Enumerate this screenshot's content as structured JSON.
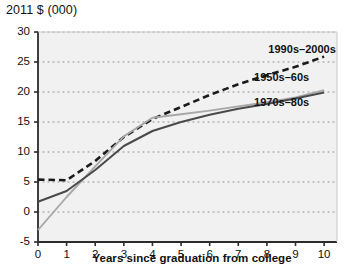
{
  "chart_data": {
    "type": "line",
    "title": "",
    "ylabel": "2011 $ (000)",
    "xlabel": "Years since graduation from college",
    "x": [
      0,
      1,
      2,
      3,
      4,
      5,
      6,
      7,
      8,
      9,
      10
    ],
    "xlim": [
      0,
      10.45
    ],
    "ylim": [
      -5,
      30
    ],
    "ytick_labels": [
      "30",
      "25",
      "20",
      "15",
      "10",
      "5",
      "0",
      "-5"
    ],
    "ytick_values": [
      30,
      25,
      20,
      15,
      10,
      5,
      0,
      -5
    ],
    "xtick_labels": [
      "0",
      "1",
      "2",
      "3",
      "4",
      "5",
      "6",
      "7",
      "8",
      "9",
      "10"
    ],
    "xtick_values": [
      0,
      1,
      2,
      3,
      4,
      5,
      6,
      7,
      8,
      9,
      10
    ],
    "grid": true,
    "grid_style": "dotted-horizontal",
    "legend_position": "inline-annotations",
    "series": [
      {
        "name": "1990s-2000s",
        "label": "1990s–2000s",
        "color": "#1a1a1a",
        "style": "dashed",
        "width": 2.6,
        "label_x": 8.05,
        "label_y": 27.0,
        "values": [
          5.4,
          5.3,
          8.5,
          12.5,
          15.5,
          17.5,
          19.5,
          21.3,
          22.8,
          24.2,
          25.9
        ]
      },
      {
        "name": "1950s-60s",
        "label": "1950s–60s",
        "color": "#a8a8a8",
        "style": "solid",
        "width": 1.9,
        "label_x": 7.55,
        "label_y": 22.4,
        "values": [
          -3.0,
          2.5,
          7.6,
          12.6,
          15.7,
          16.3,
          16.9,
          17.6,
          18.3,
          19.1,
          20.3
        ]
      },
      {
        "name": "1970s-80s",
        "label": "1970s–80s",
        "color": "#4a4a4a",
        "style": "solid",
        "width": 2.0,
        "label_x": 7.55,
        "label_y": 18.1,
        "values": [
          1.7,
          3.5,
          7.0,
          11.0,
          13.5,
          15.0,
          16.2,
          17.2,
          18.0,
          18.9,
          19.9
        ]
      }
    ],
    "colors": {
      "axis": "#2b2b2b",
      "grid": "#8d8d8d",
      "plot_background": "#f1f1f1",
      "text": "#111111"
    }
  }
}
